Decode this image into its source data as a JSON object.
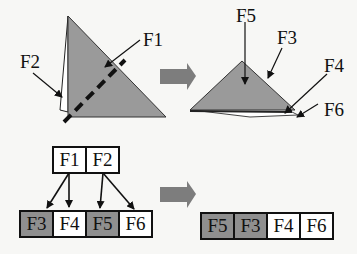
{
  "colors": {
    "fold_fill": "#9a9a9a",
    "shade_cell": "#8f8f8f",
    "plain_cell": "#ffffff",
    "arrow_big": "#7d7d7d"
  },
  "top_left": {
    "labels": {
      "f1": "F1",
      "f2": "F2"
    }
  },
  "top_right": {
    "labels": {
      "f5": "F5",
      "f3": "F3",
      "f4": "F4",
      "f6": "F6"
    }
  },
  "tree": {
    "parents": [
      "F1",
      "F2"
    ],
    "children": [
      {
        "label": "F3",
        "shaded": true
      },
      {
        "label": "F4",
        "shaded": false
      },
      {
        "label": "F5",
        "shaded": true
      },
      {
        "label": "F6",
        "shaded": false
      }
    ]
  },
  "result_row": [
    {
      "label": "F5",
      "shaded": true
    },
    {
      "label": "F3",
      "shaded": true
    },
    {
      "label": "F4",
      "shaded": false
    },
    {
      "label": "F6",
      "shaded": false
    }
  ]
}
